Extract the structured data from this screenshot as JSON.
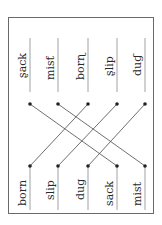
{
  "worksheet": {
    "type": "word-matching",
    "orientation": "rotated-90-ccw",
    "left_column": {
      "label": "scrambled-spelling words",
      "items": [
        {
          "text": "sack",
          "display": "ʂack"
        },
        {
          "text": "mist",
          "display": "misƭ"
        },
        {
          "text": "born",
          "display": "borɳ"
        },
        {
          "text": "slip",
          "display": "ʂlip"
        },
        {
          "text": "dug",
          "display": "duɠ"
        }
      ]
    },
    "right_column": {
      "items": [
        {
          "text": "born"
        },
        {
          "text": "slip"
        },
        {
          "text": "dug"
        },
        {
          "text": "sack"
        },
        {
          "text": "mist"
        }
      ]
    },
    "connections": [
      {
        "from": 0,
        "to": 3
      },
      {
        "from": 1,
        "to": 4
      },
      {
        "from": 2,
        "to": 0
      },
      {
        "from": 3,
        "to": 1
      },
      {
        "from": 4,
        "to": 2
      }
    ],
    "colors": {
      "line": "#4a4a4a",
      "dot": "#222222",
      "frame": "#6a6a6a",
      "text": "#2a2a2a"
    }
  }
}
